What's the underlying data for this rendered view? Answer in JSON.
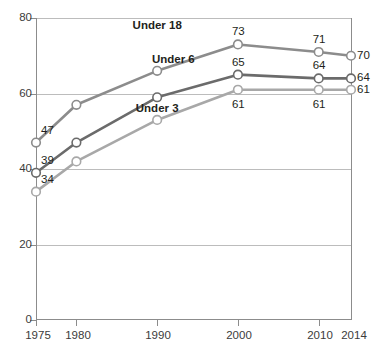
{
  "chart_data": {
    "type": "line",
    "title": "",
    "subtitle": "",
    "xlabel": "",
    "ylabel": "",
    "x": [
      1975,
      1980,
      1990,
      2000,
      2010,
      2014
    ],
    "xtick_labels": [
      "1975",
      "1980",
      "1990",
      "2000",
      "2010",
      "2014"
    ],
    "ytick_labels": [
      "0",
      "20",
      "40",
      "60",
      "80"
    ],
    "yticks": [
      0,
      20,
      40,
      60,
      80
    ],
    "ylim": [
      0,
      80
    ],
    "xlim": [
      1975,
      2014
    ],
    "grid": "horizontal",
    "legend_position": "inline-annotations",
    "series": [
      {
        "name": "Under 18",
        "color": "#8c8c8c",
        "values": [
          47,
          57,
          66,
          73,
          71,
          70
        ],
        "point_labels": [
          "47",
          "",
          "",
          "73",
          "71",
          ""
        ],
        "end_label": "70"
      },
      {
        "name": "Under 6",
        "color": "#6b6b6b",
        "values": [
          39,
          47,
          59,
          65,
          64,
          64
        ],
        "point_labels": [
          "39",
          "",
          "",
          "65",
          "64",
          ""
        ],
        "end_label": "64"
      },
      {
        "name": "Under 3",
        "color": "#a8a8a8",
        "values": [
          34,
          42,
          53,
          61,
          61,
          61
        ],
        "point_labels": [
          "34",
          "",
          "",
          "61",
          "61",
          ""
        ],
        "end_label": "61"
      }
    ],
    "annotations": [
      {
        "text": "Under 18",
        "x": 1990,
        "y": 78
      },
      {
        "text": "Under 6",
        "x": 1992,
        "y": 69
      },
      {
        "text": "Under 3",
        "x": 1990,
        "y": 56
      }
    ]
  },
  "axis": {
    "y_ticks": [
      {
        "label": "80",
        "value": 80
      },
      {
        "label": "60",
        "value": 60
      },
      {
        "label": "40",
        "value": 40
      },
      {
        "label": "20",
        "value": 20
      },
      {
        "label": "0",
        "value": 0
      }
    ],
    "x_ticks": [
      {
        "label": "1975",
        "value": 1975
      },
      {
        "label": "1980",
        "value": 1980
      },
      {
        "label": "1990",
        "value": 1990
      },
      {
        "label": "2000",
        "value": 2000
      },
      {
        "label": "2010",
        "value": 2010
      },
      {
        "label": "2014",
        "value": 2014
      }
    ]
  },
  "colors": {
    "axis": "#8c8c8c",
    "grid": "#bcbcbc",
    "text": "#231f20",
    "marker_fill": "#ffffff"
  }
}
